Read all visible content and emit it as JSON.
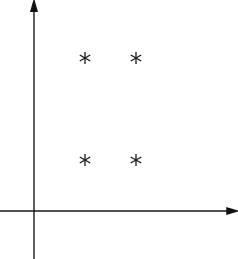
{
  "chart_data": {
    "type": "scatter",
    "title": "",
    "xlabel": "",
    "ylabel": "",
    "xlim": [
      -0.45,
      3.75
    ],
    "ylim": [
      -0.9,
      4.0
    ],
    "grid": false,
    "legend": null,
    "marker": "asterisk",
    "axes": {
      "x_arrow": true,
      "y_arrow": true,
      "ticks": false
    },
    "series": [
      {
        "name": "points",
        "points": [
          {
            "x": 1,
            "y": 3
          },
          {
            "x": 2,
            "y": 3
          },
          {
            "x": 1,
            "y": 1
          },
          {
            "x": 2,
            "y": 1
          }
        ]
      }
    ]
  },
  "colors": {
    "ink": "#1a1a1a",
    "background": "#ffffff"
  }
}
